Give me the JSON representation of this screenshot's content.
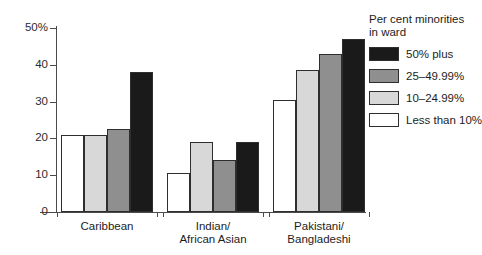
{
  "chart_data": {
    "type": "bar",
    "title": "",
    "xlabel": "",
    "ylabel": "",
    "ylim": [
      0,
      50
    ],
    "ytick_labels": [
      "50%",
      "40",
      "30",
      "20",
      "10",
      "0"
    ],
    "ytick_values": [
      50,
      40,
      30,
      20,
      10,
      0
    ],
    "grid": false,
    "legend_position": "right",
    "legend_title": "Per cent minorities\nin ward",
    "categories": [
      "Caribbean",
      "Indian/\nAfrican Asian",
      "Pakistani/\nBangladeshi"
    ],
    "series": [
      {
        "name": "Less than 10%",
        "color": "#ffffff",
        "values": [
          21,
          10.5,
          30.5
        ]
      },
      {
        "name": "10–24.99%",
        "color": "#d8d8d8",
        "values": [
          21,
          19,
          38.5
        ]
      },
      {
        "name": "25–49.99%",
        "color": "#8f8f8f",
        "values": [
          22.5,
          14,
          43
        ]
      },
      {
        "name": "50% plus",
        "color": "#1a1a1a",
        "values": [
          38,
          19,
          47
        ]
      }
    ],
    "legend_order": [
      "50% plus",
      "25–49.99%",
      "10–24.99%",
      "Less than 10%"
    ]
  },
  "legend": {
    "title": "Per cent minorities\nin ward",
    "items": [
      {
        "label": "50% plus",
        "color": "#1a1a1a"
      },
      {
        "label": "25–49.99%",
        "color": "#8f8f8f"
      },
      {
        "label": "10–24.99%",
        "color": "#d8d8d8"
      },
      {
        "label": "Less than 10%",
        "color": "#ffffff"
      }
    ]
  },
  "axes": {
    "y_labels": [
      "50%",
      "40",
      "30",
      "20",
      "10",
      "0"
    ],
    "x_labels": [
      "Caribbean",
      "Indian/\nAfrican Asian",
      "Pakistani/\nBangladeshi"
    ]
  }
}
